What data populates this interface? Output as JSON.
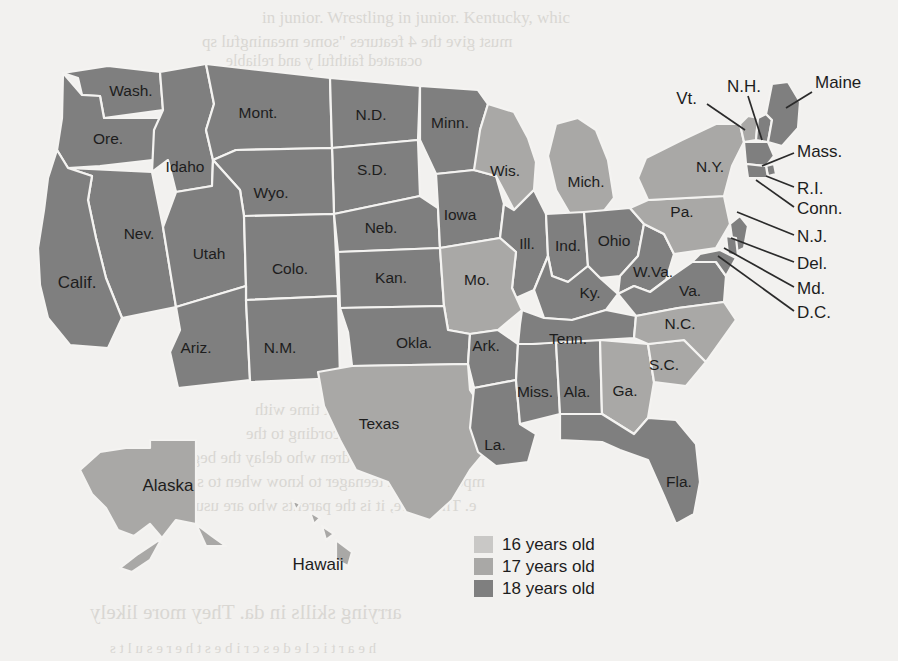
{
  "figure": {
    "kind": "choropleth-map",
    "region": "United States",
    "colors": {
      "age16": "#c9c8c6",
      "age17": "#a9a8a6",
      "age18": "#7f7f7f",
      "border": "#f4f3f1",
      "background": "#f2f1ef",
      "label": "#1d1d1d",
      "leader": "#2b2b2b"
    }
  },
  "legend": {
    "items": [
      {
        "label": "16 years old",
        "color": "#c9c8c6",
        "key": "age16"
      },
      {
        "label": "17 years old",
        "color": "#a9a8a6",
        "key": "age17"
      },
      {
        "label": "18 years old",
        "color": "#7f7f7f",
        "key": "age18"
      }
    ]
  },
  "chart_data": {
    "type": "map",
    "title": "",
    "value_field": "age",
    "categories": [
      "16 years old",
      "17 years old",
      "18 years old"
    ],
    "states": [
      {
        "label": "Wash.",
        "name": "Washington",
        "age": "18 years old",
        "color": "#7f7f7f",
        "x": 131,
        "y": 92
      },
      {
        "label": "Ore.",
        "name": "Oregon",
        "age": "18 years old",
        "color": "#7f7f7f",
        "x": 108,
        "y": 140
      },
      {
        "label": "Idaho",
        "name": "Idaho",
        "age": "18 years old",
        "color": "#7f7f7f",
        "x": 185,
        "y": 168
      },
      {
        "label": "Mont.",
        "name": "Montana",
        "age": "18 years old",
        "color": "#7f7f7f",
        "x": 258,
        "y": 114
      },
      {
        "label": "N.D.",
        "name": "North Dakota",
        "age": "18 years old",
        "color": "#7f7f7f",
        "x": 371,
        "y": 116
      },
      {
        "label": "Minn.",
        "name": "Minnesota",
        "age": "18 years old",
        "color": "#7f7f7f",
        "x": 450,
        "y": 124
      },
      {
        "label": "S.D.",
        "name": "South Dakota",
        "age": "18 years old",
        "color": "#7f7f7f",
        "x": 372,
        "y": 171
      },
      {
        "label": "Wyo.",
        "name": "Wyoming",
        "age": "18 years old",
        "color": "#7f7f7f",
        "x": 271,
        "y": 194
      },
      {
        "label": "Nev.",
        "name": "Nevada",
        "age": "18 years old",
        "color": "#7f7f7f",
        "x": 139,
        "y": 235
      },
      {
        "label": "Utah",
        "name": "Utah",
        "age": "18 years old",
        "color": "#7f7f7f",
        "x": 209,
        "y": 255
      },
      {
        "label": "Calif.",
        "name": "California",
        "age": "18 years old",
        "color": "#7f7f7f",
        "x": 77,
        "y": 284
      },
      {
        "label": "Colo.",
        "name": "Colorado",
        "age": "18 years old",
        "color": "#7f7f7f",
        "x": 290,
        "y": 270
      },
      {
        "label": "Neb.",
        "name": "Nebraska",
        "age": "18 years old",
        "color": "#7f7f7f",
        "x": 381,
        "y": 229
      },
      {
        "label": "Iowa",
        "name": "Iowa",
        "age": "18 years old",
        "color": "#7f7f7f",
        "x": 460,
        "y": 216
      },
      {
        "label": "Wis.",
        "name": "Wisconsin",
        "age": "17 years old",
        "color": "#a9a8a6",
        "x": 505,
        "y": 172
      },
      {
        "label": "Mich.",
        "name": "Michigan",
        "age": "17 years old",
        "color": "#a9a8a6",
        "x": 586,
        "y": 183
      },
      {
        "label": "Ill.",
        "name": "Illinois",
        "age": "18 years old",
        "color": "#7f7f7f",
        "x": 527,
        "y": 245
      },
      {
        "label": "Ind.",
        "name": "Indiana",
        "age": "18 years old",
        "color": "#7f7f7f",
        "x": 568,
        "y": 247
      },
      {
        "label": "Ohio",
        "name": "Ohio",
        "age": "18 years old",
        "color": "#7f7f7f",
        "x": 614,
        "y": 242
      },
      {
        "label": "Kan.",
        "name": "Kansas",
        "age": "18 years old",
        "color": "#7f7f7f",
        "x": 391,
        "y": 279
      },
      {
        "label": "Mo.",
        "name": "Missouri",
        "age": "17 years old",
        "color": "#a9a8a6",
        "x": 477,
        "y": 281
      },
      {
        "label": "Ky.",
        "name": "Kentucky",
        "age": "18 years old",
        "color": "#7f7f7f",
        "x": 590,
        "y": 294
      },
      {
        "label": "W.Va.",
        "name": "West Virginia",
        "age": "18 years old",
        "color": "#7f7f7f",
        "x": 653,
        "y": 273
      },
      {
        "label": "Va.",
        "name": "Virginia",
        "age": "18 years old",
        "color": "#7f7f7f",
        "x": 690,
        "y": 292
      },
      {
        "label": "Pa.",
        "name": "Pennsylvania",
        "age": "17 years old",
        "color": "#a9a8a6",
        "x": 682,
        "y": 213
      },
      {
        "label": "N.Y.",
        "name": "New York",
        "age": "17 years old",
        "color": "#a9a8a6",
        "x": 710,
        "y": 168
      },
      {
        "label": "Ariz.",
        "name": "Arizona",
        "age": "18 years old",
        "color": "#7f7f7f",
        "x": 196,
        "y": 349
      },
      {
        "label": "N.M.",
        "name": "New Mexico",
        "age": "18 years old",
        "color": "#7f7f7f",
        "x": 280,
        "y": 349
      },
      {
        "label": "Okla.",
        "name": "Oklahoma",
        "age": "18 years old",
        "color": "#7f7f7f",
        "x": 414,
        "y": 344
      },
      {
        "label": "Ark.",
        "name": "Arkansas",
        "age": "18 years old",
        "color": "#7f7f7f",
        "x": 486,
        "y": 347
      },
      {
        "label": "Texas",
        "name": "Texas",
        "age": "17 years old",
        "color": "#a9a8a6",
        "x": 379,
        "y": 425
      },
      {
        "label": "La.",
        "name": "Louisiana",
        "age": "18 years old",
        "color": "#7f7f7f",
        "x": 495,
        "y": 446
      },
      {
        "label": "Miss.",
        "name": "Mississippi",
        "age": "18 years old",
        "color": "#7f7f7f",
        "x": 535,
        "y": 393
      },
      {
        "label": "Ala.",
        "name": "Alabama",
        "age": "18 years old",
        "color": "#7f7f7f",
        "x": 577,
        "y": 393
      },
      {
        "label": "Tenn.",
        "name": "Tennessee",
        "age": "18 years old",
        "color": "#7f7f7f",
        "x": 568,
        "y": 340
      },
      {
        "label": "Ga.",
        "name": "Georgia",
        "age": "17 years old",
        "color": "#a9a8a6",
        "x": 625,
        "y": 392
      },
      {
        "label": "S.C.",
        "name": "South Carolina",
        "age": "17 years old",
        "color": "#a9a8a6",
        "x": 664,
        "y": 366
      },
      {
        "label": "N.C.",
        "name": "North Carolina",
        "age": "17 years old",
        "color": "#a9a8a6",
        "x": 680,
        "y": 325
      },
      {
        "label": "Fla.",
        "name": "Florida",
        "age": "18 years old",
        "color": "#7f7f7f",
        "x": 679,
        "y": 483
      },
      {
        "label": "Alaska",
        "name": "Alaska",
        "age": "17 years old",
        "color": "#a9a8a6",
        "x": 168,
        "y": 487
      },
      {
        "label": "Hawaii",
        "name": "Hawaii",
        "age": "17 years old",
        "color": "#a9a8a6",
        "x": 318,
        "y": 566
      }
    ],
    "callout_states": [
      {
        "label": "Vt.",
        "name": "Vermont",
        "age": "17 years old",
        "color": "#a9a8a6",
        "tx": 697,
        "ty": 100,
        "anchor": "end",
        "lx": 707,
        "ly": 104,
        "px": 745,
        "py": 130
      },
      {
        "label": "N.H.",
        "name": "New Hampshire",
        "age": "18 years old",
        "color": "#7f7f7f",
        "tx": 744,
        "ty": 88,
        "anchor": "middle",
        "lx": 748,
        "ly": 96,
        "px": 762,
        "py": 140
      },
      {
        "label": "Maine",
        "name": "Maine",
        "age": "18 years old",
        "color": "#7f7f7f",
        "tx": 815,
        "ty": 84,
        "anchor": "start",
        "lx": 812,
        "ly": 92,
        "px": 786,
        "py": 108
      },
      {
        "label": "Mass.",
        "name": "Massachusetts",
        "age": "18 years old",
        "color": "#7f7f7f",
        "tx": 797,
        "ty": 153,
        "anchor": "start",
        "lx": 794,
        "ly": 153,
        "px": 762,
        "py": 166
      },
      {
        "label": "R.I.",
        "name": "Rhode Island",
        "age": "18 years old",
        "color": "#7f7f7f",
        "tx": 797,
        "ty": 190,
        "anchor": "start",
        "lx": 794,
        "ly": 187,
        "px": 766,
        "py": 176
      },
      {
        "label": "Conn.",
        "name": "Connecticut",
        "age": "18 years old",
        "color": "#7f7f7f",
        "tx": 797,
        "ty": 210,
        "anchor": "start",
        "lx": 794,
        "ly": 207,
        "px": 756,
        "py": 180
      },
      {
        "label": "N.J.",
        "name": "New Jersey",
        "age": "18 years old",
        "color": "#7f7f7f",
        "tx": 797,
        "ty": 238,
        "anchor": "start",
        "lx": 794,
        "ly": 235,
        "px": 737,
        "py": 212
      },
      {
        "label": "Del.",
        "name": "Delaware",
        "age": "18 years old",
        "color": "#7f7f7f",
        "tx": 797,
        "ty": 265,
        "anchor": "start",
        "lx": 794,
        "ly": 262,
        "px": 731,
        "py": 238
      },
      {
        "label": "Md.",
        "name": "Maryland",
        "age": "18 years old",
        "color": "#7f7f7f",
        "tx": 797,
        "ty": 290,
        "anchor": "start",
        "lx": 794,
        "ly": 287,
        "px": 724,
        "py": 248
      },
      {
        "label": "D.C.",
        "name": "District of Columbia",
        "age": "18 years old",
        "color": "#7f7f7f",
        "tx": 797,
        "ty": 314,
        "anchor": "start",
        "lx": 794,
        "ly": 311,
        "px": 718,
        "py": 256
      }
    ]
  },
  "background_text": {
    "lines": [
      {
        "text": "in junior. Wrestling in junior. Kentucky, whic",
        "x": 262,
        "y": 8,
        "size": 17,
        "flip": false
      },
      {
        "text": "must give the 4 features \"some meaningful sp",
        "x": 202,
        "y": 32,
        "size": 17,
        "flip": true
      },
      {
        "text": "ocarated faithful y and reliable",
        "x": 226,
        "y": 52,
        "size": 16,
        "flip": true
      },
      {
        "text": "n spent time with",
        "x": 255,
        "y": 400,
        "size": 17,
        "flip": true
      },
      {
        "text": "s. According to the",
        "x": 246,
        "y": 424,
        "size": 17,
        "flip": true
      },
      {
        "text": "ssen to children who delay the beginn",
        "x": 170,
        "y": 448,
        "size": 17,
        "flip": true
      },
      {
        "text": "mportant for a teenager to know when to sea",
        "x": 182,
        "y": 472,
        "size": 17,
        "flip": true
      },
      {
        "text": "e. Therefore, it is the parents who are usually",
        "x": 170,
        "y": 496,
        "size": 17,
        "flip": true
      },
      {
        "text": "arrying skills in da. They more likely",
        "x": 90,
        "y": 600,
        "size": 21,
        "flip": true
      },
      {
        "text": "h e  a r t i c l e   d e s c r i b e s  t h e  r e s u l t s",
        "x": 110,
        "y": 640,
        "size": 15,
        "flip": true
      }
    ]
  }
}
